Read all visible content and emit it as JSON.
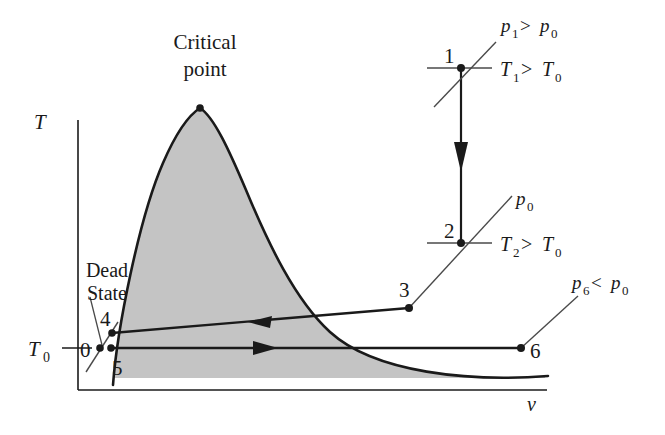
{
  "figure": {
    "axes": {
      "y_axis_label": "T",
      "x_axis_label": "v",
      "y_tick_label": "T0",
      "y_tick_label_base": "T",
      "y_tick_label_sub": "0"
    },
    "annotations": {
      "critical_point_line1": "Critical",
      "critical_point_line2": "point",
      "dead_state_line1": "Dead",
      "dead_state_line2": "State"
    },
    "state_points": [
      {
        "id": "0",
        "label": "0",
        "x": 100,
        "y": 348
      },
      {
        "id": "1",
        "label": "1",
        "x": 461,
        "y": 68
      },
      {
        "id": "2",
        "label": "2",
        "x": 461,
        "y": 243
      },
      {
        "id": "3",
        "label": "3",
        "x": 409,
        "y": 308
      },
      {
        "id": "4",
        "label": "4",
        "x": 112,
        "y": 333
      },
      {
        "id": "5",
        "label": "5",
        "x": 112,
        "y": 348
      },
      {
        "id": "6",
        "label": "6",
        "x": 521,
        "y": 348
      }
    ],
    "pressure_labels": [
      {
        "id": "p1",
        "text": "p1 > p0",
        "base": "p",
        "sub": "1",
        "rel": " > ",
        "base2": "p",
        "sub2": "0"
      },
      {
        "id": "p0",
        "text": "p0",
        "base": "p",
        "sub": "0"
      },
      {
        "id": "p6",
        "text": "p6 < p0",
        "base": "p",
        "sub": "6",
        "rel": " < ",
        "base2": "p",
        "sub2": "0"
      }
    ],
    "temperature_labels": [
      {
        "id": "T1",
        "text": "T1 > T0",
        "base": "T",
        "sub": "1",
        "rel": " > ",
        "base2": "T",
        "sub2": "0"
      },
      {
        "id": "T2",
        "text": "T2 > T0",
        "base": "T",
        "sub": "2",
        "rel": " > ",
        "base2": "T",
        "sub2": "0"
      }
    ],
    "processes": [
      {
        "id": "1-2",
        "from": "1",
        "to": "2",
        "direction": "down",
        "type": "vertical-constant-volume"
      },
      {
        "id": "3-4",
        "from": "3",
        "to": "4",
        "direction": "left",
        "type": "horizontal-constant-temperature"
      },
      {
        "id": "5-6",
        "from": "5",
        "to": "6",
        "direction": "right",
        "type": "horizontal-constant-temperature"
      }
    ],
    "colors": {
      "dome_fill": "#c4c4c4",
      "curve_stroke": "#1a1a1a",
      "axis_stroke": "#1a1a1a",
      "leader_stroke": "#4a4a4a",
      "background": "#ffffff"
    }
  }
}
